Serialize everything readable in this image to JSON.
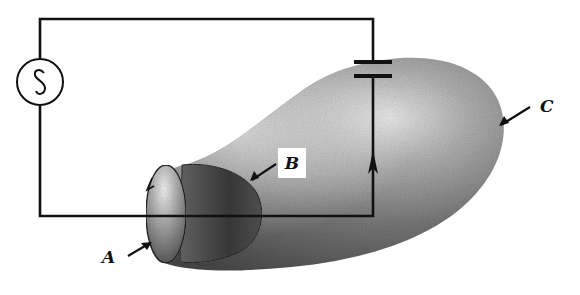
{
  "diagram": {
    "type": "physics-circuit-surface-diagram",
    "components": {
      "ac_source": {
        "symbol": "~",
        "icon": "ac-source-icon"
      },
      "capacitor": {
        "icon": "capacitor-icon"
      },
      "closed_surface": {
        "label": "C"
      },
      "flat_surface_cap": {
        "label": "A"
      },
      "bulged_surface": {
        "label": "B"
      }
    },
    "labels": {
      "A": "A",
      "B": "B",
      "C": "C"
    },
    "colors": {
      "wire": "#111111",
      "surface_dark": "#3a3a3a",
      "surface_light": "#e6e6e6",
      "background": "#ffffff"
    }
  }
}
